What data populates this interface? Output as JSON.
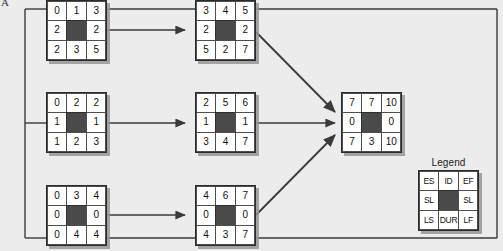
{
  "figure": {
    "corner_label": "A",
    "background_color": "#ececec",
    "node_fill_color": "#ffffff",
    "node_center_color": "#4a4a4a",
    "line_color": "#3a3a3a"
  },
  "legend": {
    "title": "Legend",
    "cells": [
      "ES",
      "ID",
      "EF",
      "SL",
      "",
      "SL",
      "LS",
      "DUR",
      "LF"
    ]
  },
  "nodes": [
    {
      "name": "node-a",
      "row_top": [
        "0",
        "1",
        "3"
      ],
      "row_mid": [
        "2",
        "",
        "2"
      ],
      "row_bot": [
        "2",
        "3",
        "5"
      ]
    },
    {
      "name": "node-b",
      "row_top": [
        "3",
        "4",
        "5"
      ],
      "row_mid": [
        "2",
        "",
        "2"
      ],
      "row_bot": [
        "5",
        "2",
        "7"
      ]
    },
    {
      "name": "node-c",
      "row_top": [
        "0",
        "2",
        "2"
      ],
      "row_mid": [
        "1",
        "",
        "1"
      ],
      "row_bot": [
        "1",
        "2",
        "3"
      ]
    },
    {
      "name": "node-d",
      "row_top": [
        "2",
        "5",
        "6"
      ],
      "row_mid": [
        "1",
        "",
        "1"
      ],
      "row_bot": [
        "3",
        "4",
        "7"
      ]
    },
    {
      "name": "node-e",
      "row_top": [
        "0",
        "3",
        "4"
      ],
      "row_mid": [
        "0",
        "",
        "0"
      ],
      "row_bot": [
        "0",
        "4",
        "4"
      ]
    },
    {
      "name": "node-f",
      "row_top": [
        "4",
        "6",
        "7"
      ],
      "row_mid": [
        "0",
        "",
        "0"
      ],
      "row_bot": [
        "4",
        "3",
        "7"
      ]
    },
    {
      "name": "node-finish",
      "row_top": [
        "7",
        "7",
        "10"
      ],
      "row_mid": [
        "0",
        "",
        "0"
      ],
      "row_bot": [
        "7",
        "3",
        "10"
      ]
    }
  ]
}
